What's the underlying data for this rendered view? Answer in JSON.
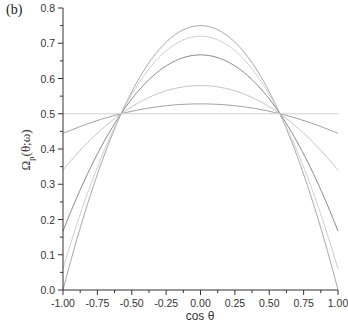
{
  "panel_label": "(b)",
  "chart_data": {
    "type": "line",
    "title": "",
    "xlabel": "cos θ",
    "ylabel": "Ω_p(θ;ω)",
    "xlim": [
      -1.0,
      1.0
    ],
    "ylim": [
      0.0,
      0.8
    ],
    "grid": false,
    "legend": null,
    "x_ticks": [
      "-1.00",
      "-0.75",
      "-0.50",
      "-0.25",
      "0.00",
      "0.25",
      "0.50",
      "0.75",
      "1.00"
    ],
    "y_ticks": [
      "0.0",
      "0.1",
      "0.2",
      "0.3",
      "0.4",
      "0.5",
      "0.6",
      "0.7",
      "0.8"
    ],
    "annotations": [
      "All curves cross at cos θ ≈ ±0.577, Ω = 0.5"
    ],
    "series": [
      {
        "name": "curve-1",
        "peak_at_0": 0.75,
        "value_at_pm1": 0.0,
        "color": "#a8a8a8"
      },
      {
        "name": "curve-2",
        "peak_at_0": 0.72,
        "value_at_pm1": 0.06,
        "color": "#cfcfcf"
      },
      {
        "name": "curve-3",
        "peak_at_0": 0.667,
        "value_at_pm1": 0.167,
        "color": "#8a8a8a"
      },
      {
        "name": "curve-4",
        "peak_at_0": 0.58,
        "value_at_pm1": 0.34,
        "color": "#c4c4c4"
      },
      {
        "name": "curve-5",
        "peak_at_0": 0.528,
        "value_at_pm1": 0.444,
        "color": "#a0a0a0"
      },
      {
        "name": "curve-6",
        "peak_at_0": 0.5,
        "value_at_pm1": 0.5,
        "color": "#d0d0d0"
      }
    ]
  }
}
